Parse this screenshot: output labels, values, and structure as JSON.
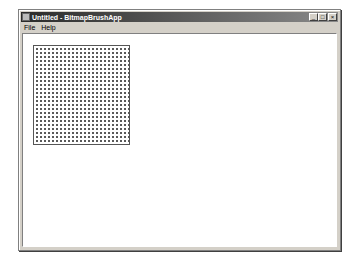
{
  "window": {
    "title": "Untitled - BitmapBrushApp",
    "controls": {
      "minimize": "_",
      "maximize": "□",
      "close": "×"
    }
  },
  "menubar": {
    "items": [
      {
        "label": "File"
      },
      {
        "label": "Help"
      }
    ]
  },
  "client": {
    "bitmap_brush_fill": {
      "pattern": "dot-grid",
      "dot_color": "#5a5a5a",
      "background": "#ffffff"
    }
  }
}
